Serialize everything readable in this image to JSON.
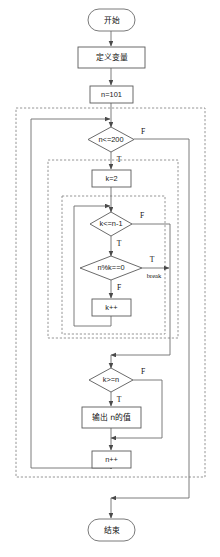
{
  "diagram": {
    "language": "zh-CN",
    "background_color": "#ffffff",
    "line_color": "#6e6e6e",
    "dashed_group_color": "#8a8a8a",
    "text_color": "#111111"
  },
  "nodes": {
    "start": {
      "label": "开始",
      "shape": "terminator"
    },
    "define_vars": {
      "label": "定义变量",
      "shape": "process"
    },
    "init_n": {
      "label": "n=101",
      "shape": "process"
    },
    "cond_n": {
      "label": "n<=200",
      "shape": "decision"
    },
    "init_k": {
      "label": "k=2",
      "shape": "process"
    },
    "cond_k": {
      "label": "k<=n-1",
      "shape": "decision"
    },
    "cond_mod": {
      "label": "n%k==0",
      "shape": "decision"
    },
    "inc_k": {
      "label": "k++",
      "shape": "process"
    },
    "cond_kn": {
      "label": "k>=n",
      "shape": "decision"
    },
    "output_n": {
      "label": "输出 n的值",
      "shape": "process"
    },
    "inc_n": {
      "label": "n++",
      "shape": "process"
    },
    "end": {
      "label": "结束",
      "shape": "terminator"
    }
  },
  "edge_labels": {
    "cond_n_false": "F",
    "cond_n_true": "T",
    "cond_k_false": "F",
    "cond_k_true": "T",
    "cond_mod_true": "T",
    "cond_mod_false": "F",
    "break_label": "break",
    "cond_kn_false": "F",
    "cond_kn_true": "T"
  },
  "groups": {
    "outer_loop": {
      "name": "outer-while-loop-group"
    },
    "inner_loop": {
      "name": "inner-while-loop-group"
    },
    "innermost_loop": {
      "name": "innermost-check-loop-group"
    }
  }
}
